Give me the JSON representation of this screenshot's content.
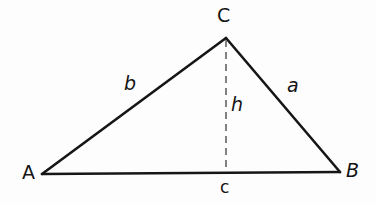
{
  "figure": {
    "background_color": "#fdfdfd",
    "stroke_color": "#161616",
    "dash_color": "#6d6d6d",
    "width": 376,
    "height": 203
  },
  "vertices": {
    "a": {
      "label": "A",
      "x": 42,
      "y": 174,
      "label_x": 22,
      "label_y": 163
    },
    "b": {
      "label": "B",
      "x": 340,
      "y": 172,
      "label_x": 346,
      "label_y": 161
    },
    "c": {
      "label": "C",
      "x": 226,
      "y": 38,
      "label_x": 217,
      "label_y": 6
    }
  },
  "sides": {
    "side_a": {
      "label": "a",
      "label_x": 287,
      "label_y": 76,
      "from": "C",
      "to": "B"
    },
    "side_b": {
      "label": "b",
      "label_x": 124,
      "label_y": 74,
      "from": "A",
      "to": "C"
    },
    "side_c": {
      "label": "c",
      "label_x": 220,
      "label_y": 179,
      "from": "A",
      "to": "B"
    }
  },
  "altitude": {
    "label": "h",
    "label_x": 231,
    "label_y": 95,
    "from_x": 226,
    "from_y": 40,
    "to_x": 226,
    "to_y": 172,
    "dash_pattern": "7 5"
  },
  "geometry": {
    "path_base": "M 42 174 L 340 172",
    "path_side_b": "M 42 174 L 226 38",
    "path_side_a": "M 226 38 L 340 172",
    "stroke_width": 2.6,
    "altitude_stroke_width": 1.7
  }
}
